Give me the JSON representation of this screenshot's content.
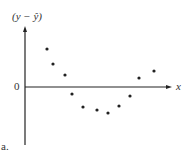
{
  "chart_data": {
    "type": "scatter",
    "title": "",
    "xlabel": "x",
    "ylabel": "(y − ŷ)",
    "y_zero_label": "0",
    "panel_label": "a.",
    "grid": false,
    "legend": null,
    "x": [
      1,
      2,
      3,
      4,
      5,
      6,
      7,
      8,
      9,
      10,
      11
    ],
    "y": [
      3.0,
      1.8,
      0.9,
      -0.6,
      -1.6,
      -1.9,
      -2.1,
      -1.5,
      -0.7,
      0.7,
      1.3
    ],
    "pixel_points": [
      [
        47,
        49
      ],
      [
        53,
        64
      ],
      [
        65,
        75
      ],
      [
        72,
        94
      ],
      [
        83,
        107
      ],
      [
        97,
        110
      ],
      [
        108,
        113
      ],
      [
        119,
        106
      ],
      [
        130,
        96
      ],
      [
        139,
        78
      ],
      [
        154,
        71
      ]
    ],
    "note": "Residual plot showing U-shaped (curvilinear) pattern"
  },
  "labels": {
    "ylabel": "(y − ŷ)",
    "xlabel": "x",
    "zero": "0",
    "panel": "a."
  }
}
